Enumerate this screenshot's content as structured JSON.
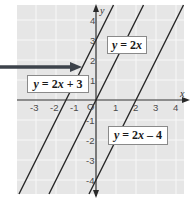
{
  "chart_data": {
    "type": "line",
    "title": "",
    "xlabel": "x",
    "ylabel": "y",
    "xlim": [
      -4,
      4
    ],
    "ylim": [
      -4.5,
      4.5
    ],
    "grid": true,
    "x_ticks": [
      "-3",
      "-2",
      "-1",
      "O",
      "1",
      "2",
      "3",
      "4"
    ],
    "y_ticks": [
      "4",
      "3",
      "2",
      "1",
      "-1",
      "-2",
      "-3",
      "-4"
    ],
    "series": [
      {
        "name": "y = 2x + 3",
        "slope": 2,
        "intercept": 3,
        "points": [
          [
            -3.5,
            -4
          ],
          [
            0,
            3
          ],
          [
            0.5,
            4
          ]
        ]
      },
      {
        "name": "y = 2x",
        "slope": 2,
        "intercept": 0,
        "points": [
          [
            -2,
            -4
          ],
          [
            0,
            0
          ],
          [
            2,
            4
          ]
        ]
      },
      {
        "name": "y = 2x - 4",
        "slope": 2,
        "intercept": -4,
        "points": [
          [
            0,
            -4
          ],
          [
            2,
            0
          ],
          [
            4,
            4
          ]
        ]
      }
    ],
    "annotations": [
      {
        "text": "y = 2x + 3",
        "type": "label-with-arrow",
        "points_to": [
          -0.75,
          1.5
        ]
      },
      {
        "text": "y = 2x",
        "type": "label"
      },
      {
        "text": "y = 2x - 4",
        "type": "label"
      }
    ],
    "colors": {
      "background": "#e8e8e8",
      "grid": "#f6f6f6",
      "line": "#2a2a2a",
      "axis": "#2a2a2a",
      "arrow": "#3a3f47"
    }
  },
  "labels": {
    "line1": {
      "y": "y",
      "eq": " = 2",
      "x": "x",
      "rest": " + 3"
    },
    "line2": {
      "y": "y",
      "eq": " = 2",
      "x": "x",
      "rest": ""
    },
    "line3": {
      "y": "y",
      "eq": " = 2",
      "x": "x",
      "rest": " – 4"
    }
  },
  "axes": {
    "x_label": "x",
    "y_label": "y",
    "origin": "O",
    "x_ticks": [
      {
        "v": -3,
        "t": "-3"
      },
      {
        "v": -2,
        "t": "-2"
      },
      {
        "v": -1,
        "t": "-1"
      },
      {
        "v": 1,
        "t": "1"
      },
      {
        "v": 2,
        "t": "2"
      },
      {
        "v": 3,
        "t": "3"
      },
      {
        "v": 4,
        "t": "4"
      }
    ],
    "y_ticks": [
      {
        "v": 4,
        "t": "4"
      },
      {
        "v": 3,
        "t": "3"
      },
      {
        "v": 2,
        "t": "2"
      },
      {
        "v": 1,
        "t": "1"
      },
      {
        "v": -1,
        "t": "-1"
      },
      {
        "v": -2,
        "t": "-2"
      },
      {
        "v": -3,
        "t": "-3"
      },
      {
        "v": -4,
        "t": "-4"
      }
    ]
  }
}
